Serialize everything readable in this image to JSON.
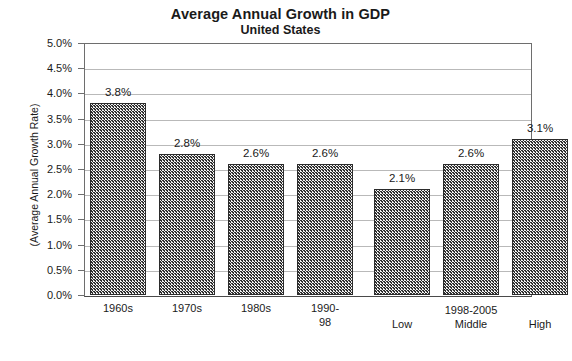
{
  "chart_data": {
    "type": "bar",
    "title": "Average Annual Growth in GDP",
    "subtitle": "United States",
    "xlabel": "",
    "ylabel": "(Average Annual Growth Rate)",
    "ylim": [
      0,
      5
    ],
    "ytick_labels": [
      "5.0%",
      "4.5%",
      "4.0%",
      "3.5%",
      "3.0%",
      "2.5%",
      "2.0%",
      "1.5%",
      "1.0%",
      "0.5%",
      "0.0%"
    ],
    "ytick_values": [
      5.0,
      4.5,
      4.0,
      3.5,
      3.0,
      2.5,
      2.0,
      1.5,
      1.0,
      0.5,
      0.0
    ],
    "grid": true,
    "legend": "none",
    "categories": [
      "1960s",
      "1970s",
      "1980s",
      "1990-\n98",
      "Low",
      "Middle",
      "High"
    ],
    "values": [
      3.8,
      2.8,
      2.6,
      2.6,
      2.1,
      2.6,
      3.1
    ],
    "value_labels": [
      "3.8%",
      "2.8%",
      "2.6%",
      "2.6%",
      "2.1%",
      "2.6%",
      "3.1%"
    ],
    "groups": [
      {
        "label": "",
        "categories": [
          "1960s",
          "1970s",
          "1980s",
          "1990-\n98"
        ]
      },
      {
        "label": "1998-2005",
        "categories": [
          "Low",
          "Middle",
          "High"
        ]
      }
    ],
    "bars": [
      {
        "category": "1960s",
        "value": 3.8,
        "label": "3.8%",
        "x": 6,
        "width": 56,
        "group": 0
      },
      {
        "category": "1970s",
        "value": 2.8,
        "label": "2.8%",
        "x": 75,
        "width": 56,
        "group": 0
      },
      {
        "category": "1980s",
        "value": 2.6,
        "label": "2.6%",
        "x": 144,
        "width": 56,
        "group": 0
      },
      {
        "category": "1990-\n98",
        "value": 2.6,
        "label": "2.6%",
        "x": 213,
        "width": 56,
        "group": 0
      },
      {
        "category": "Low",
        "value": 2.1,
        "label": "2.1%",
        "x": 290,
        "width": 56,
        "group": 1
      },
      {
        "category": "Middle",
        "value": 2.6,
        "label": "2.6%",
        "x": 359,
        "width": 56,
        "group": 1
      },
      {
        "category": "High",
        "value": 3.1,
        "label": "3.1%",
        "x": 428,
        "width": 56,
        "group": 1
      }
    ],
    "group_label_positions": [
      {
        "label": "1998-2005",
        "center": 387
      }
    ],
    "colors": {
      "bar_fill": "#9a9a9a",
      "bar_stroke": "#2b2b2b",
      "gridline": "#b9b9b9",
      "axis": "#6e6e6e",
      "text": "#1a1a1a",
      "background": "#ffffff"
    }
  }
}
